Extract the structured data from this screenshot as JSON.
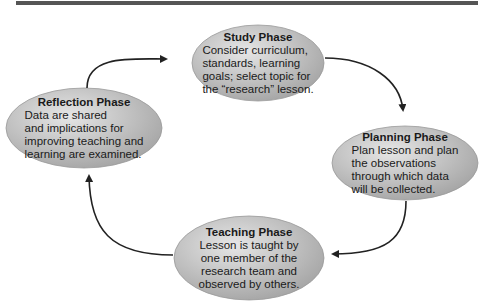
{
  "diagram": {
    "type": "cycle",
    "colors": {
      "ellipse_fill_light": "#e2e2e2",
      "ellipse_fill_dark": "#a8a8a8",
      "arrow": "#222222",
      "topbar": "#555555"
    },
    "nodes": [
      {
        "id": "study",
        "title": "Study Phase",
        "lines": [
          "Consider curriculum,",
          "standards, learning",
          "goals; select topic for",
          "the “research” lesson."
        ]
      },
      {
        "id": "planning",
        "title": "Planning Phase",
        "lines": [
          "Plan lesson and plan",
          "the observations",
          "through which data",
          "will be collected."
        ]
      },
      {
        "id": "teaching",
        "title": "Teaching Phase",
        "lines": [
          "Lesson is taught by",
          "one member of the",
          "research team and",
          "observed by others."
        ]
      },
      {
        "id": "reflection",
        "title": "Reflection Phase",
        "lines": [
          "Data are shared",
          "and implications for",
          "improving teaching and",
          "learning are examined."
        ]
      }
    ],
    "edges": [
      {
        "from": "study",
        "to": "planning"
      },
      {
        "from": "planning",
        "to": "teaching"
      },
      {
        "from": "teaching",
        "to": "reflection"
      },
      {
        "from": "reflection",
        "to": "study"
      }
    ]
  }
}
